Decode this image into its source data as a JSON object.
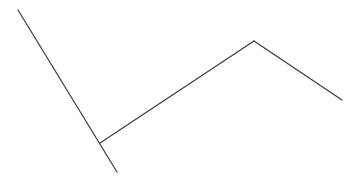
{
  "diagram": {
    "stroke_color": "#3a3a3a",
    "stroke_width": 1.2,
    "background": "#ffffff",
    "segments": [
      {
        "name": "long-diagonal-line",
        "x1": 18,
        "y1": 10,
        "x2": 117,
        "y2": 172
      },
      {
        "name": "rising-line",
        "x1": 100,
        "y1": 143,
        "x2": 254,
        "y2": 41
      },
      {
        "name": "falling-line",
        "x1": 254,
        "y1": 41,
        "x2": 342,
        "y2": 100
      }
    ]
  }
}
